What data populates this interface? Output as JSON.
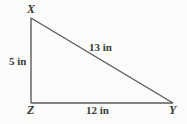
{
  "figure": {
    "kind": "right-triangle-diagram",
    "unit": "in",
    "background_color": "#fbfbfa",
    "stroke_color": "#5a5a5a",
    "text_color": "#3b3b3b",
    "vertices": [
      {
        "name": "X",
        "label": "X",
        "x": 31,
        "y": 18,
        "role": "apex"
      },
      {
        "name": "Z",
        "label": "Z",
        "x": 31,
        "y": 103,
        "role": "right-angle"
      },
      {
        "name": "Y",
        "label": "Y",
        "x": 173,
        "y": 103,
        "role": "base-right"
      }
    ],
    "sides": [
      {
        "name": "XZ",
        "label": "5 in",
        "value": 5,
        "orientation": "vertical",
        "from": "X",
        "to": "Z"
      },
      {
        "name": "ZY",
        "label": "12 in",
        "value": 12,
        "orientation": "horizontal",
        "from": "Z",
        "to": "Y"
      },
      {
        "name": "XY",
        "label": "13 in",
        "value": 13,
        "orientation": "diagonal",
        "from": "X",
        "to": "Y"
      }
    ]
  }
}
